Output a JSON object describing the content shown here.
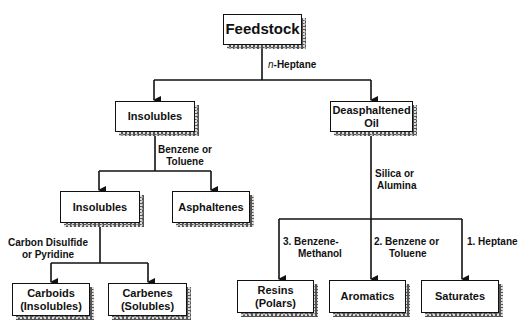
{
  "diagram": {
    "type": "flowchart",
    "nodes": {
      "feedstock": "Feedstock",
      "insolubles_1": "Insolubles",
      "deasphaltened_line1": "Deasphaltened",
      "deasphaltened_line2": "Oil",
      "insolubles_2": "Insolubles",
      "asphaltenes": "Asphaltenes",
      "carboids_line1": "Carboids",
      "carboids_line2": "(Insolubles)",
      "carbenes_line1": "Carbenes",
      "carbenes_line2": "(Solubles)",
      "resins_line1": "Resins",
      "resins_line2": "(Polars)",
      "aromatics": "Aromatics",
      "saturates": "Saturates"
    },
    "edge_labels": {
      "n_prefix": "n",
      "heptane_suffix": "-Heptane",
      "benzene_toluene_1_line1": "Benzene  or",
      "benzene_toluene_1_line2": "Toluene",
      "carbon_disulfide_line1": "Carbon  Disulfide",
      "carbon_disulfide_line2": "or  Pyridine",
      "silica_line1": "Silica  or",
      "silica_line2": "Alumina",
      "step3_line1": "3.  Benzene-",
      "step3_line2": "Methanol",
      "step2_line1": "2.  Benzene  or",
      "step2_line2": "Toluene",
      "step1": "1.  Heptane"
    },
    "edges": [
      {
        "from": "Feedstock",
        "to": "Insolubles",
        "via": "n-Heptane"
      },
      {
        "from": "Feedstock",
        "to": "Deasphaltened Oil",
        "via": "n-Heptane"
      },
      {
        "from": "Insolubles",
        "to": "Insolubles",
        "via": "Benzene or Toluene"
      },
      {
        "from": "Insolubles",
        "to": "Asphaltenes",
        "via": "Benzene or Toluene"
      },
      {
        "from": "Insolubles",
        "to": "Carboids (Insolubles)",
        "via": "Carbon Disulfide or Pyridine"
      },
      {
        "from": "Insolubles",
        "to": "Carbenes (Solubles)",
        "via": "Carbon Disulfide or Pyridine"
      },
      {
        "from": "Deasphaltened Oil",
        "to": "Resins (Polars)",
        "via": "3. Benzene-Methanol"
      },
      {
        "from": "Deasphaltened Oil",
        "to": "Aromatics",
        "via": "2. Benzene or Toluene"
      },
      {
        "from": "Deasphaltened Oil",
        "to": "Saturates",
        "via": "1. Heptane"
      }
    ],
    "colors": {
      "line": "#111111",
      "box_fill": "#ffffff",
      "shadow": "#555555"
    }
  }
}
